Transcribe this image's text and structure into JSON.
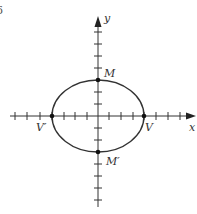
{
  "figure": {
    "number_label": "6",
    "axes": {
      "x_label": "x",
      "y_label": "y"
    },
    "points": {
      "M": "M",
      "M_prime": "M′",
      "V": "V",
      "V_prime": "V′"
    },
    "ellipse": {
      "semi_major_ticks": 4,
      "semi_minor_ticks": 3
    },
    "colors": {
      "stroke": "#333333"
    }
  }
}
